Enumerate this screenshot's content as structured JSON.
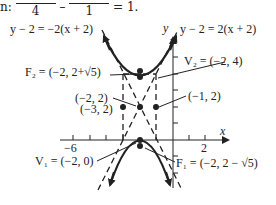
{
  "header": {
    "prefix": "n:",
    "frac1_den": "4",
    "minus": "–",
    "frac2_den": "1",
    "equals": "= 1."
  },
  "labels": {
    "asym_neg": "y − 2 = −2(x + 2)",
    "asym_pos": "y − 2 = 2(x + 2)",
    "y_axis": "y",
    "x_axis": "x",
    "F2": "F₂ = (−2, 2+√5)",
    "V2": "V₂ = (−2, 4)",
    "center": "(−2, 2)",
    "left_pt": "(−3, 2)",
    "right_pt": "(−1, 2)",
    "V1": "V₁ = (−2, 0)",
    "F1": "F₁ = (−2, 2 − √5)",
    "tick_neg6": "−6",
    "tick_2": "2"
  },
  "colors": {
    "ink": "#222222",
    "background": "#ffffff"
  }
}
